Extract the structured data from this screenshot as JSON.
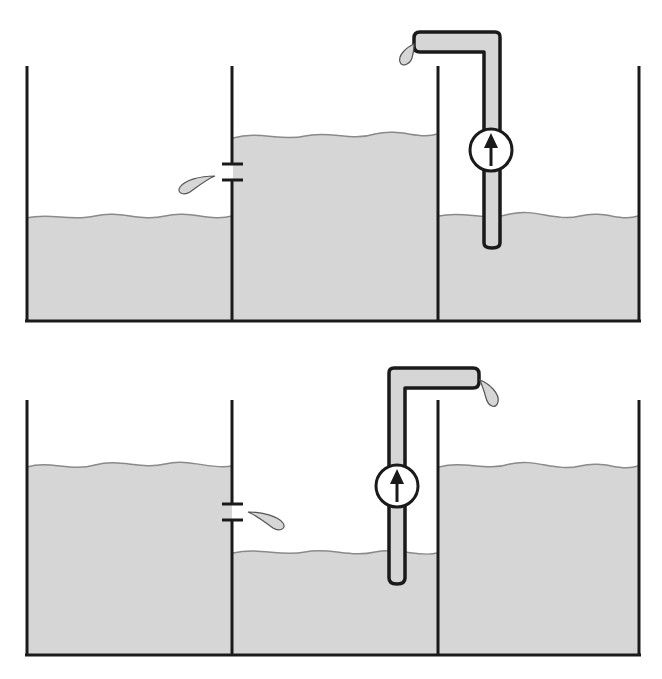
{
  "diagram": {
    "title": "",
    "colors": {
      "water": "#d6d6d6",
      "surface_line": "#8a8a8a",
      "outline": "#1a1a1a",
      "background": "#ffffff"
    },
    "panels": [
      {
        "id": "top",
        "tanks": [
          {
            "position": "left",
            "level": "low"
          },
          {
            "position": "middle",
            "level": "high"
          },
          {
            "position": "right",
            "level": "low"
          }
        ],
        "leak": {
          "from": "middle",
          "to": "left",
          "icon": "water-drop-icon"
        },
        "pump": {
          "from": "right",
          "to": "middle",
          "icon": "up-arrow-icon"
        }
      },
      {
        "id": "bottom",
        "tanks": [
          {
            "position": "left",
            "level": "high"
          },
          {
            "position": "middle",
            "level": "low"
          },
          {
            "position": "right",
            "level": "high"
          }
        ],
        "leak": {
          "from": "left",
          "to": "middle",
          "icon": "water-drop-icon"
        },
        "pump": {
          "from": "middle",
          "to": "right",
          "icon": "up-arrow-icon"
        }
      }
    ]
  }
}
